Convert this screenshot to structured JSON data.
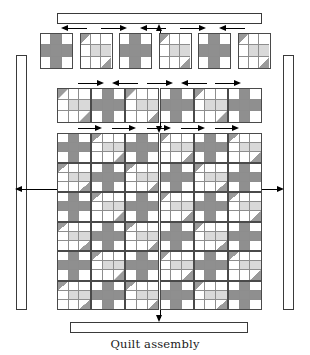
{
  "figure": {
    "caption": "Quilt assembly",
    "type": "quilt-assembly-diagram"
  },
  "palette": {
    "outline": "#3a3a3a",
    "block_outline": "#4a4a4a",
    "seam_line": "#8d8d8d",
    "dark_patch": "#8f8f8f",
    "light_patch": "#d9d9d9",
    "triangle_gray": "#9a9a9a",
    "triangle_light": "#d4d4d4",
    "background": "#ffffff",
    "arrow": "#000000",
    "caption_color": "#1b1b1b"
  },
  "block_types": {
    "plus": {
      "name": "plus-block",
      "label": "Plus block",
      "grid": "3x3",
      "cells": [
        "white",
        "dark",
        "white",
        "dark",
        "dark",
        "dark",
        "white",
        "dark",
        "white"
      ]
    },
    "triangle": {
      "name": "triangle-block",
      "label": "Half-square-triangle block",
      "grid": "3x3",
      "cells": [
        "hst-tl",
        "white",
        "white",
        "white",
        "light",
        "light",
        "white",
        "white",
        "hst-br"
      ]
    }
  },
  "borders": {
    "top": {
      "name": "top-border-strip",
      "orientation": "horizontal"
    },
    "bottom": {
      "name": "bottom-border-strip",
      "orientation": "horizontal"
    },
    "left": {
      "name": "left-border-strip",
      "orientation": "vertical"
    },
    "right": {
      "name": "right-border-strip",
      "orientation": "vertical"
    }
  },
  "block_row": {
    "name": "individual-blocks-row",
    "count": 6,
    "sequence": [
      "plus",
      "triangle",
      "plus",
      "triangle",
      "plus",
      "triangle"
    ],
    "arrow_directions": [
      "left",
      "right",
      "left",
      "right",
      "left"
    ]
  },
  "joined_row": {
    "name": "joined-block-row",
    "count": 6,
    "sequence": [
      "triangle",
      "plus",
      "triangle",
      "plus",
      "triangle",
      "plus"
    ],
    "arrow_directions": [
      "right",
      "left",
      "right",
      "left",
      "right"
    ]
  },
  "quilt_body": {
    "name": "quilt-center-grid",
    "rows": 6,
    "columns": 6,
    "layout": "checkerboard-alternating",
    "arrow_directions": [
      "right",
      "right",
      "right",
      "right",
      "right"
    ],
    "rows_data": [
      [
        "plus",
        "triangle",
        "plus",
        "triangle",
        "plus",
        "triangle"
      ],
      [
        "triangle",
        "plus",
        "triangle",
        "plus",
        "triangle",
        "plus"
      ],
      [
        "plus",
        "triangle",
        "plus",
        "triangle",
        "plus",
        "triangle"
      ],
      [
        "triangle",
        "plus",
        "triangle",
        "plus",
        "triangle",
        "plus"
      ],
      [
        "plus",
        "triangle",
        "plus",
        "triangle",
        "plus",
        "triangle"
      ],
      [
        "triangle",
        "plus",
        "triangle",
        "plus",
        "triangle",
        "plus"
      ]
    ]
  },
  "assembly_arrows": {
    "top_to_border": {
      "name": "arrow-up-to-top-border",
      "direction": "up"
    },
    "bottom_to_border": {
      "name": "arrow-down-to-bottom-border",
      "direction": "down"
    },
    "left_to_border": {
      "name": "arrow-left-to-left-border",
      "direction": "left"
    },
    "right_to_border": {
      "name": "arrow-right-to-right-border",
      "direction": "right"
    },
    "row_to_body": {
      "name": "arrow-down-row-to-body",
      "direction": "down"
    }
  }
}
